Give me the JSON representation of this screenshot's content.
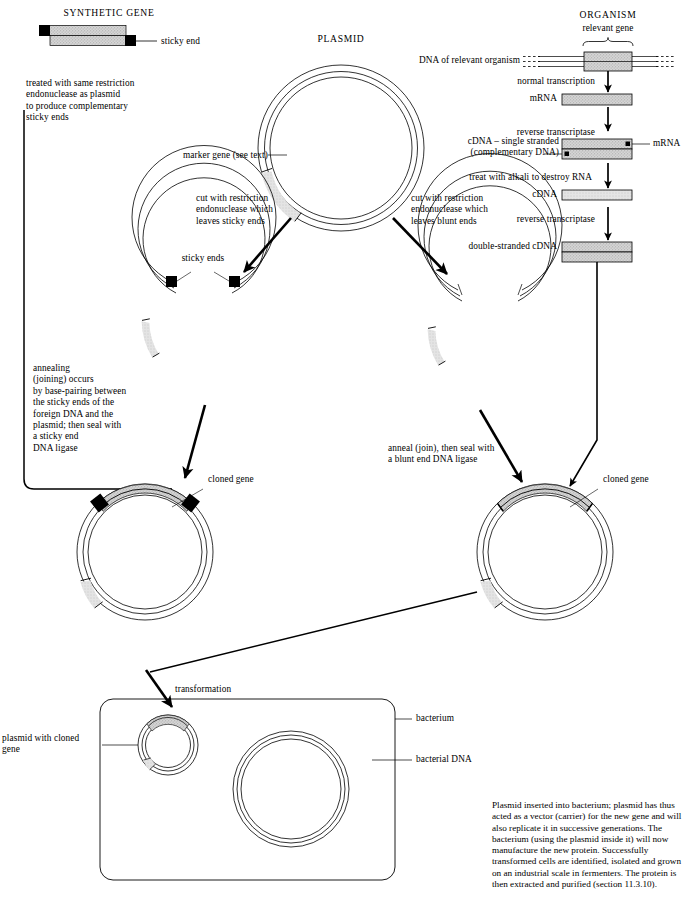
{
  "diagram": {
    "headings": {
      "synthetic_gene": "SYNTHETIC GENE",
      "plasmid": "PLASMID",
      "organism": "ORGANISM"
    },
    "labels": {
      "sticky_end": "sticky end",
      "relevant_gene": "relevant gene",
      "dna_of_relevant_organism": "DNA of relevant organism",
      "normal_transcription": "normal transcription",
      "mrna": "mRNA",
      "reverse_transcriptase_1": "reverse transcriptase",
      "cdna_single_stranded": "cDNA – single stranded\n(complementary DNA)",
      "mrna_side": "mRNA",
      "treat_with_alkali": "treat with alkali to destroy RNA",
      "cdna": "cDNA",
      "reverse_transcriptase_2": "reverse transcriptase",
      "double_stranded_cdna": "double-stranded cDNA",
      "marker_gene": "marker gene (see text)",
      "cut_sticky": "cut with restriction\nendonuclease which\nleaves sticky ends",
      "cut_blunt": "cut with restriction\nendonuclease which\nleaves blunt ends",
      "sticky_ends": "sticky ends",
      "treated_with": "treated with same restriction\nendonuclease as plasmid\nto produce complementary\nsticky ends",
      "annealing": "annealing\n(joining) occurs\nby base-pairing between\nthe sticky ends of the\nforeign DNA and the\nplasmid; then seal with\na sticky end\nDNA ligase",
      "anneal_blunt": "anneal (join), then seal with\na blunt end DNA ligase",
      "cloned_gene_left": "cloned gene",
      "cloned_gene_right": "cloned gene",
      "transformation": "transformation",
      "bacterium": "bacterium",
      "bacterial_dna": "bacterial DNA",
      "plasmid_with_cloned_gene": "plasmid with cloned\ngene"
    },
    "caption": "Plasmid inserted into bacterium; plasmid has\nthus acted as a vector (carrier) for the new\ngene and will also replicate it in successive\ngenerations. The bacterium (using the\nplasmid inside it) will now manufacture the\nnew protein. Successfully transformed cells\nare identified, isolated and grown on an\nindustrial scale in fermenters. The protein is\nthen extracted and purified (section 11.3.10).",
    "colors": {
      "line": "#000000",
      "fill_gene": "#c8c8c8",
      "fill_light": "#d9d9d9",
      "sticky_end": "#000000",
      "background": "#ffffff"
    }
  }
}
